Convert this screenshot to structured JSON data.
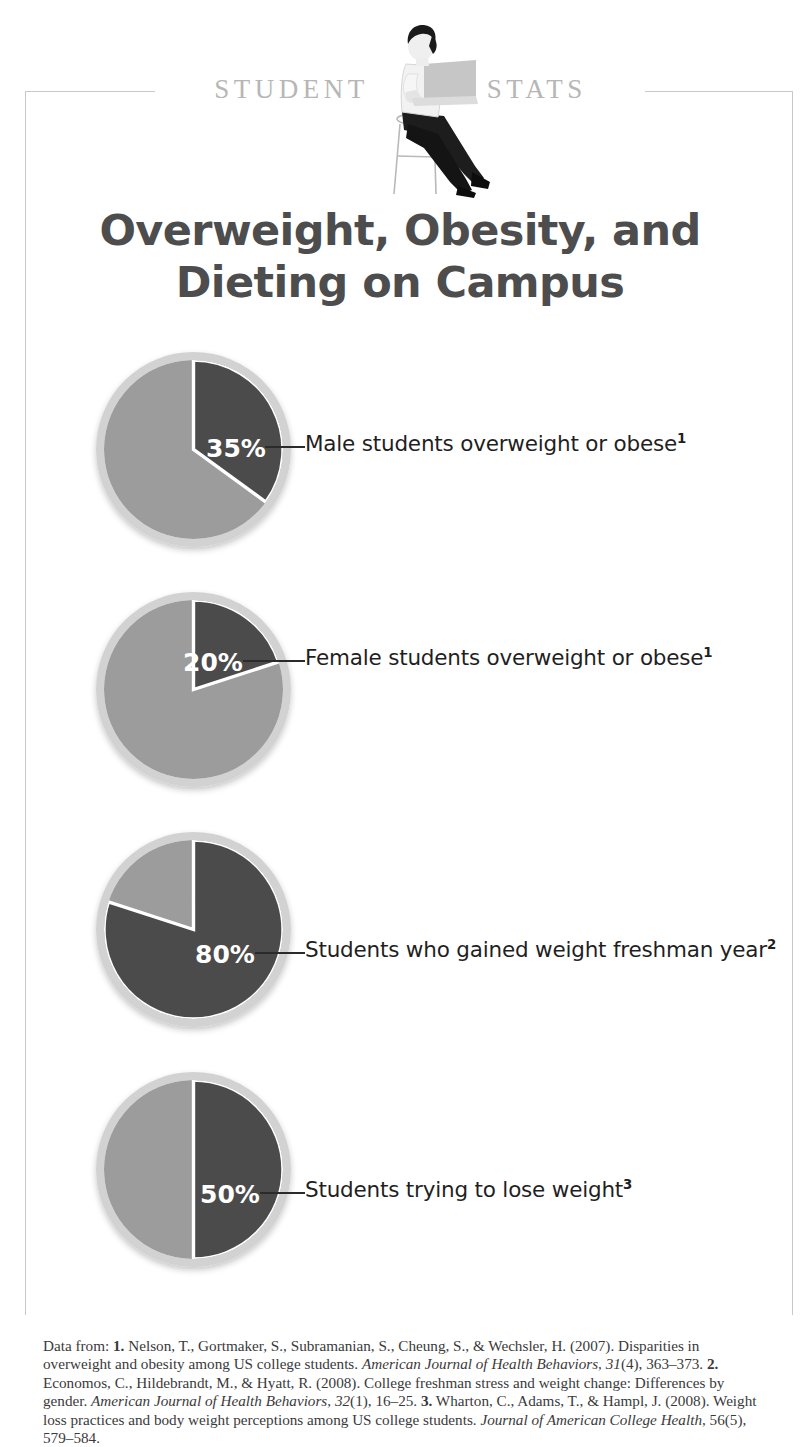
{
  "masthead": {
    "word_left": "STUDENT",
    "word_right": "STATS",
    "illustration": "seated-student-with-laptop"
  },
  "title": {
    "line1": "Overweight, Obesity, and",
    "line2": "Dieting on Campus"
  },
  "colors": {
    "highlight_slice": "#4b4b4b",
    "remainder_slice": "#9c9c9c",
    "rim": "#d0d0d0",
    "title_text": "#4d4d4d",
    "body_text": "#1f1f1f",
    "masthead_text": "#b6b6b6",
    "frame_border": "#c9c9c9",
    "pct_text": "#ffffff"
  },
  "chart_data": [
    {
      "type": "pie",
      "title": "Male students overweight or obese",
      "categories": [
        "Male students overweight or obese",
        "Remainder"
      ],
      "values": [
        35,
        65
      ],
      "value_label": "35%",
      "footnote": "1",
      "highlight_color": "#4b4b4b",
      "remainder_color": "#9c9c9c",
      "start_angle_deg": 0,
      "direction": "clockwise",
      "legend": "none",
      "grid": false
    },
    {
      "type": "pie",
      "title": "Female students overweight or obese",
      "categories": [
        "Female students overweight or obese",
        "Remainder"
      ],
      "values": [
        20,
        80
      ],
      "value_label": "20%",
      "footnote": "1",
      "highlight_color": "#4b4b4b",
      "remainder_color": "#9c9c9c",
      "start_angle_deg": 0,
      "direction": "clockwise",
      "legend": "none",
      "grid": false
    },
    {
      "type": "pie",
      "title": "Students who gained weight freshman year",
      "categories": [
        "Students who gained weight freshman year",
        "Remainder"
      ],
      "values": [
        80,
        20
      ],
      "value_label": "80%",
      "footnote": "2",
      "highlight_color": "#4b4b4b",
      "remainder_color": "#9c9c9c",
      "start_angle_deg": 0,
      "direction": "clockwise",
      "legend": "none",
      "grid": false
    },
    {
      "type": "pie",
      "title": "Students trying to lose weight",
      "categories": [
        "Students trying to lose weight",
        "Remainder"
      ],
      "values": [
        50,
        50
      ],
      "value_label": "50%",
      "footnote": "3",
      "highlight_color": "#4b4b4b",
      "remainder_color": "#9c9c9c",
      "start_angle_deg": 0,
      "direction": "clockwise",
      "legend": "none",
      "grid": false
    }
  ],
  "stats": [
    {
      "percent": "35%",
      "label": "Male students overweight or obese",
      "footnote": "1",
      "pct_left": 206,
      "pct_top": 82,
      "leader_left": 265,
      "leader_top": 94,
      "leader_width": 40,
      "text_left": 305,
      "text_top": 79
    },
    {
      "percent": "20%",
      "label": "Female students overweight or obese",
      "footnote": "1",
      "pct_left": 183,
      "pct_top": 56,
      "leader_left": 243,
      "leader_top": 68,
      "leader_width": 62,
      "text_left": 305,
      "text_top": 53
    },
    {
      "percent": "80%",
      "label": "Students who gained weight freshman year",
      "footnote": "2",
      "pct_left": 195,
      "pct_top": 108,
      "leader_left": 255,
      "leader_top": 120,
      "leader_width": 50,
      "text_left": 305,
      "text_top": 105
    },
    {
      "percent": "50%",
      "label": "Students trying to lose weight",
      "footnote": "3",
      "pct_left": 200,
      "pct_top": 108,
      "leader_left": 260,
      "leader_top": 120,
      "leader_width": 45,
      "text_left": 305,
      "text_top": 105
    }
  ],
  "citations": {
    "prefix": "Data from: ",
    "entries": [
      {
        "number": "1.",
        "authors": " Nelson, T., Gortmaker, S., Subramanian, S., Cheung, S., & Wechsler, H. (2007). Disparities in overweight and obesity among US college students. ",
        "journal": "American Journal of Health Behaviors, 31",
        "detail": "(4), 363–373. "
      },
      {
        "number": "2.",
        "authors": " Economos, C., Hildebrandt, M., & Hyatt, R. (2008). College freshman stress and weight change: Differences by gender. ",
        "journal": "American Journal of Health Behaviors, 32",
        "detail": "(1), 16–25. "
      },
      {
        "number": "3.",
        "authors": " Wharton, C., Adams, T., & Hampl, J. (2008). Weight loss practices and body weight perceptions among US college students. ",
        "journal": "Journal of American College Health,",
        "detail": " 56(5), 579–584."
      }
    ]
  }
}
